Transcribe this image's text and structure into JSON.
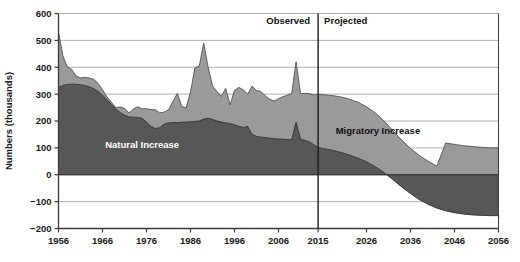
{
  "chart_data": {
    "type": "area",
    "stacked": true,
    "title": "",
    "xlabel": "",
    "ylabel": "Numbers (thousands)",
    "xlim": [
      1956,
      2056
    ],
    "ylim": [
      -200,
      600
    ],
    "ytick_step": 100,
    "grid": true,
    "grid_axis": "y",
    "y_ticks": [
      "600",
      "500",
      "400",
      "300",
      "200",
      "100",
      "0",
      "-100",
      "-200"
    ],
    "x_ticks": [
      "1956",
      "1966",
      "1976",
      "1986",
      "1996",
      "2006",
      "2015",
      "2026",
      "2036",
      "2046",
      "2056"
    ],
    "annotations": [
      {
        "text": "Observed",
        "x": 2002,
        "y": 560
      },
      {
        "text": "Projected",
        "x": 2020,
        "y": 560
      },
      {
        "text": "Natural Increase",
        "x": 1975,
        "y": 100
      },
      {
        "text": "Migratory Increase",
        "x": 2019,
        "y": 150
      }
    ],
    "divider": {
      "label": "2015",
      "x": 2015
    },
    "colors": {
      "natural_increase": "#575757",
      "migratory_increase": "#9a9a9a",
      "axis": "#3a3a3a",
      "grid": "#8c8c8c",
      "divider": "#1a1a1a"
    },
    "series": [
      {
        "name": "Natural Increase",
        "x": [
          1956,
          1957,
          1958,
          1959,
          1960,
          1961,
          1962,
          1963,
          1964,
          1965,
          1966,
          1967,
          1968,
          1969,
          1970,
          1971,
          1972,
          1973,
          1974,
          1975,
          1976,
          1977,
          1978,
          1979,
          1980,
          1981,
          1982,
          1983,
          1984,
          1985,
          1986,
          1987,
          1988,
          1989,
          1990,
          1991,
          1992,
          1993,
          1994,
          1995,
          1996,
          1997,
          1998,
          1999,
          2000,
          2001,
          2002,
          2003,
          2004,
          2005,
          2006,
          2007,
          2008,
          2009,
          2010,
          2011,
          2012,
          2013,
          2014,
          2015,
          2016,
          2018,
          2020,
          2022,
          2024,
          2026,
          2028,
          2030,
          2032,
          2034,
          2036,
          2038,
          2040,
          2042,
          2044,
          2046,
          2048,
          2050,
          2052,
          2054,
          2056
        ],
        "values": [
          325,
          332,
          336,
          337,
          337,
          335,
          332,
          327,
          320,
          310,
          296,
          280,
          262,
          245,
          232,
          222,
          215,
          214,
          213,
          210,
          196,
          180,
          172,
          175,
          188,
          193,
          194,
          194,
          195,
          196,
          197,
          198,
          200,
          207,
          210,
          206,
          200,
          196,
          193,
          190,
          186,
          180,
          176,
          180,
          150,
          143,
          140,
          138,
          136,
          134,
          133,
          132,
          131,
          130,
          195,
          132,
          128,
          122,
          112,
          102,
          98,
          92,
          84,
          74,
          62,
          48,
          30,
          8,
          -18,
          -45,
          -70,
          -92,
          -110,
          -124,
          -134,
          -141,
          -146,
          -149,
          -151,
          -152,
          -152
        ]
      },
      {
        "name": "Migratory Increase",
        "x": [
          1956,
          1957,
          1958,
          1959,
          1960,
          1961,
          1962,
          1963,
          1964,
          1965,
          1966,
          1967,
          1968,
          1969,
          1970,
          1971,
          1972,
          1973,
          1974,
          1975,
          1976,
          1977,
          1978,
          1979,
          1980,
          1981,
          1982,
          1983,
          1984,
          1985,
          1986,
          1987,
          1988,
          1989,
          1990,
          1991,
          1992,
          1993,
          1994,
          1995,
          1996,
          1997,
          1998,
          1999,
          2000,
          2001,
          2002,
          2003,
          2004,
          2005,
          2006,
          2007,
          2008,
          2009,
          2010,
          2011,
          2012,
          2013,
          2014,
          2015,
          2016,
          2018,
          2020,
          2022,
          2024,
          2026,
          2028,
          2030,
          2032,
          2034,
          2036,
          2038,
          2040,
          2042,
          2044,
          2046,
          2048,
          2050,
          2052,
          2054,
          2056
        ],
        "values": [
          205,
          110,
          65,
          55,
          30,
          25,
          30,
          33,
          35,
          30,
          20,
          10,
          8,
          5,
          20,
          25,
          15,
          30,
          40,
          35,
          50,
          62,
          70,
          55,
          45,
          48,
          78,
          108,
          60,
          52,
          110,
          200,
          205,
          283,
          190,
          125,
          110,
          95,
          128,
          70,
          128,
          145,
          140,
          120,
          180,
          170,
          170,
          155,
          145,
          140,
          150,
          158,
          165,
          172,
          225,
          170,
          175,
          180,
          185,
          198,
          200,
          203,
          206,
          208,
          208,
          205,
          200,
          192,
          182,
          174,
          168,
          164,
          160,
          156,
          252,
          254,
          254,
          254,
          253,
          252,
          252
        ]
      }
    ],
    "totals_note": "Total = Natural Increase + Migratory Increase (stacked top line)"
  }
}
